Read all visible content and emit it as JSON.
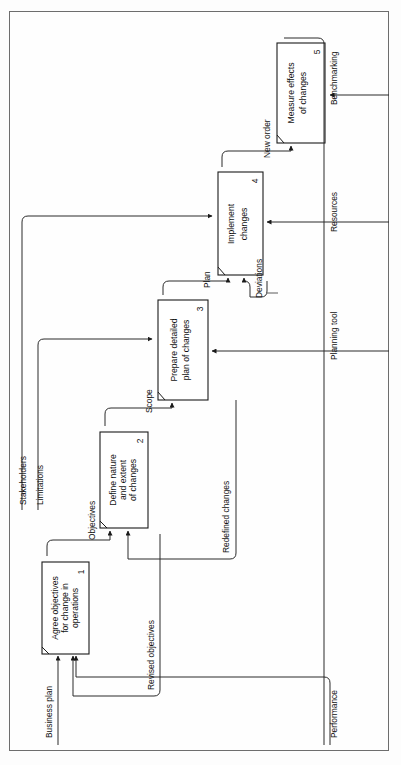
{
  "diagram": {
    "orientation": "rotated-90-ccw",
    "boxes": [
      {
        "id": 1,
        "number": "1",
        "lines": [
          "Agree objectives",
          "for change in",
          "operations"
        ]
      },
      {
        "id": 2,
        "number": "2",
        "lines": [
          "Define nature",
          "and extent",
          "of changes"
        ]
      },
      {
        "id": 3,
        "number": "3",
        "lines": [
          "Prepare detailed",
          "plan of changes"
        ]
      },
      {
        "id": 4,
        "number": "4",
        "lines": [
          "Implement",
          "changes"
        ]
      },
      {
        "id": 5,
        "number": "5",
        "lines": [
          "Measure effects",
          "of changes"
        ]
      }
    ],
    "flow_labels": [
      {
        "key": "business_plan",
        "text": "Business plan"
      },
      {
        "key": "revised_objectives",
        "text": "Revised objectives"
      },
      {
        "key": "objectives",
        "text": "Objectives"
      },
      {
        "key": "stakeholders",
        "text": "Stakeholders"
      },
      {
        "key": "limitations",
        "text": "Limitations"
      },
      {
        "key": "scope",
        "text": "Scope"
      },
      {
        "key": "redefined_changes",
        "text": "Redefined changes"
      },
      {
        "key": "plan",
        "text": "Plan"
      },
      {
        "key": "deviations",
        "text": "Deviations"
      },
      {
        "key": "new_order",
        "text": "New order"
      },
      {
        "key": "performance",
        "text": "Performance"
      },
      {
        "key": "planning_tool",
        "text": "Planning tool"
      },
      {
        "key": "resources",
        "text": "Resources"
      },
      {
        "key": "benchmarking",
        "text": "Benchmarking"
      }
    ],
    "colors": {
      "line": "#2a2a2a",
      "box_stroke": "#1a1a1a",
      "page_border": "#6d6d6d",
      "background": "#ffffff"
    }
  }
}
